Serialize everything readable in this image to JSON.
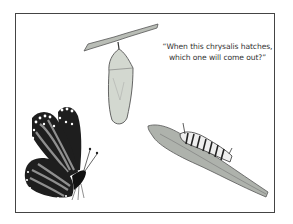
{
  "caption": {
    "line1": "“When this chrysalis hatches,",
    "line2": "which one will come out?”"
  },
  "illustrations": [
    {
      "name": "chrysalis",
      "description": "Pale green chrysalis hanging from a twig"
    },
    {
      "name": "butterfly",
      "description": "Monarch butterfly with orange, black and white wings"
    },
    {
      "name": "caterpillar",
      "description": "Striped monarch caterpillar on a leaf"
    }
  ],
  "colors": {
    "frame": "#444444",
    "chrysalis": "#cfd6cc",
    "leaf": "#a8aca6",
    "butterfly_dark": "#1e1e1e",
    "butterfly_wing": "#8f8f8f"
  }
}
